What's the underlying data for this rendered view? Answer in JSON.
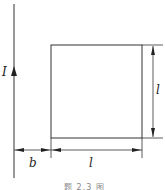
{
  "diagram": {
    "current_label": "I",
    "distance_label": "b",
    "width_label": "l",
    "height_label": "l",
    "caption": "题 2.3 图"
  },
  "colors": {
    "line": "#333333",
    "background": "#ffffff"
  }
}
